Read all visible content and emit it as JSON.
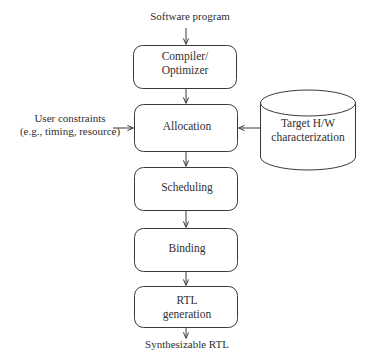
{
  "diagram": {
    "type": "flowchart",
    "colors": {
      "stroke": "#3a3a3a",
      "text": "#2f2f2f",
      "background": "#ffffff"
    },
    "inputs": {
      "software_program": "Software program",
      "user_constraints": "User constraints\n(e.g., timing, resource)"
    },
    "outputs": {
      "synthesizable_rtl": "Synthesizable RTL"
    },
    "nodes": [
      {
        "id": "compiler",
        "label": "Compiler/\nOptimizer",
        "shape": "rounded-rect"
      },
      {
        "id": "allocation",
        "label": "Allocation",
        "shape": "rounded-rect"
      },
      {
        "id": "scheduling",
        "label": "Scheduling",
        "shape": "rounded-rect"
      },
      {
        "id": "binding",
        "label": "Binding",
        "shape": "rounded-rect"
      },
      {
        "id": "rtlgen",
        "label": "RTL\ngeneration",
        "shape": "rounded-rect"
      },
      {
        "id": "targethw",
        "label": "Target H/W\ncharacterization",
        "shape": "cylinder"
      }
    ],
    "edges": [
      {
        "from": "software_program",
        "to": "compiler",
        "direction": "down"
      },
      {
        "from": "compiler",
        "to": "allocation",
        "direction": "down"
      },
      {
        "from": "user_constraints",
        "to": "allocation",
        "direction": "right"
      },
      {
        "from": "targethw",
        "to": "allocation",
        "direction": "left"
      },
      {
        "from": "allocation",
        "to": "scheduling",
        "direction": "down"
      },
      {
        "from": "scheduling",
        "to": "binding",
        "direction": "down"
      },
      {
        "from": "binding",
        "to": "rtlgen",
        "direction": "down"
      },
      {
        "from": "rtlgen",
        "to": "synthesizable_rtl",
        "direction": "down"
      }
    ]
  }
}
